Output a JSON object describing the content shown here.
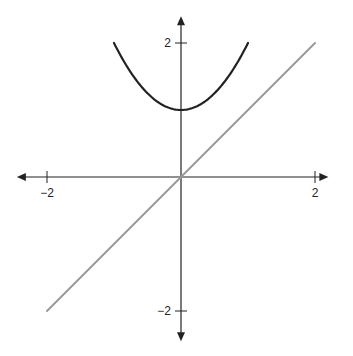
{
  "chart_data": {
    "type": "line",
    "title": "",
    "xlabel": "",
    "ylabel": "",
    "xlim": [
      -2.45,
      2.2
    ],
    "ylim": [
      -2.45,
      2.4
    ],
    "grid": false,
    "legend": null,
    "x_ticks": [
      -2,
      2
    ],
    "y_ticks": [
      -2,
      2
    ],
    "x_tick_labels": [
      "−2",
      "2"
    ],
    "y_tick_labels": [
      "−2",
      "2"
    ],
    "series": [
      {
        "name": "y = x^2 + 1",
        "color": "#222222",
        "x": [
          -1.0,
          -0.75,
          -0.5,
          -0.25,
          0,
          0.25,
          0.5,
          0.75,
          1.0
        ],
        "y": [
          2.0,
          1.5625,
          1.25,
          1.0625,
          1.0,
          1.0625,
          1.25,
          1.5625,
          2.0
        ]
      },
      {
        "name": "y = x",
        "color": "#9a9a9a",
        "x": [
          -2.0,
          2.0
        ],
        "y": [
          -2.0,
          2.0
        ]
      }
    ]
  },
  "axes": {
    "origin_px": [
      181,
      177
    ],
    "px_per_unit": 67,
    "axis_color": "#222222"
  }
}
